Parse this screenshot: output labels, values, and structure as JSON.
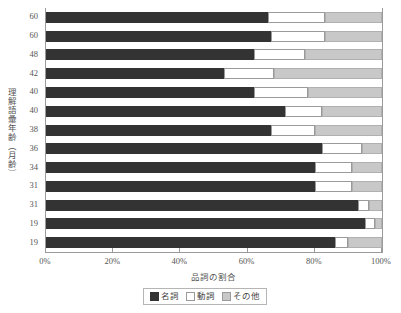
{
  "chart_data": {
    "type": "bar",
    "orientation": "horizontal",
    "stacked": true,
    "normalized": true,
    "title": "",
    "xlabel": "品詞の割合",
    "ylabel": "理解語彙年齢（月齢）",
    "xlim": [
      0,
      100
    ],
    "xticks": [
      0,
      20,
      40,
      60,
      80,
      100
    ],
    "xtick_labels": [
      "0%",
      "20%",
      "40%",
      "60%",
      "80%",
      "100%"
    ],
    "grid": false,
    "legend_position": "bottom",
    "categories": [
      "60",
      "60",
      "48",
      "42",
      "40",
      "40",
      "38",
      "36",
      "34",
      "31",
      "31",
      "19",
      "19"
    ],
    "series": [
      {
        "name": "名詞",
        "color": "#333333",
        "values": [
          66,
          67,
          62,
          53,
          62,
          71,
          67,
          82,
          80,
          80,
          93,
          95,
          86
        ]
      },
      {
        "name": "動詞",
        "color": "#ffffff",
        "values": [
          17,
          16,
          15,
          15,
          16,
          11,
          13,
          12,
          11,
          11,
          3,
          3,
          4
        ]
      },
      {
        "name": "その他",
        "color": "#c8c8c8",
        "values": [
          17,
          17,
          23,
          32,
          22,
          18,
          20,
          6,
          9,
          9,
          4,
          2,
          10
        ]
      }
    ]
  },
  "legend": {
    "items": [
      {
        "label": "名詞",
        "swatch": "dark-swatch-icon"
      },
      {
        "label": "動詞",
        "swatch": "white-swatch-icon"
      },
      {
        "label": "その他",
        "swatch": "gray-swatch-icon"
      }
    ]
  },
  "colors": {
    "noun": "#333333",
    "verb": "#ffffff",
    "other": "#c8c8c8",
    "axis": "#9a9a9a",
    "text": "#555555"
  }
}
